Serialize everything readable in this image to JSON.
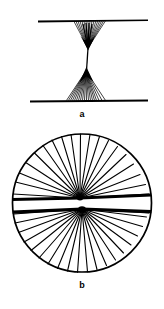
{
  "figure": {
    "background_color": "#ffffff",
    "ink_color": "#000000",
    "width": 164,
    "height": 309,
    "panels": [
      {
        "id": "a",
        "caption": "a",
        "title": "Spindle apparatus between two parallel plates",
        "description": "Hourglass-shaped bundle of fibers converging from an upper horizontal line to a central waist and diverging again to a lower horizontal line",
        "elements": {
          "top_line": {
            "x1": 38,
            "y1": 20,
            "x2": 148,
            "y2": 20
          },
          "bottom_line": {
            "x1": 30,
            "y1": 101,
            "x2": 148,
            "y2": 101
          },
          "upper_pole": {
            "x": 88,
            "y": 48
          },
          "lower_pole": {
            "x": 86,
            "y": 70
          },
          "upper_fan_count": 17,
          "lower_fan_count": 19,
          "upper_fan_span": [
            74,
            106
          ],
          "lower_fan_span": [
            66,
            106
          ]
        }
      },
      {
        "id": "b",
        "caption": "b",
        "title": "Circular cell with two asters",
        "description": "Circle containing two closely spaced centers from which fibers radiate outward in all directions, with a horizontal equatorial band between them",
        "elements": {
          "circle": {
            "cx": 82,
            "cy": 77,
            "rx": 70,
            "ry": 70
          },
          "upper_center": {
            "x": 80,
            "y": 72
          },
          "lower_center": {
            "x": 82,
            "y": 83
          },
          "upper_ray_count": 19,
          "lower_ray_count": 21,
          "equator_band": true
        }
      }
    ]
  }
}
